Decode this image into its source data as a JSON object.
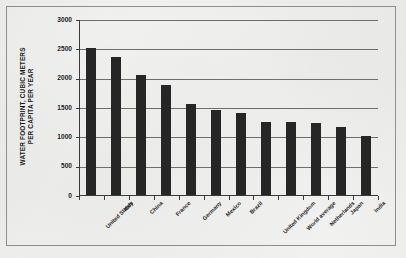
{
  "chart_data": {
    "type": "bar",
    "title": "",
    "subtitle": "",
    "xlabel": "",
    "ylabel": "WATER FOOTPRINT, CUBIC METERS\nPER CAPITA PER YEAR",
    "categories": [
      "United States",
      "Italy",
      "China",
      "France",
      "Germany",
      "Mexico",
      "Brazil",
      "United Kingdom",
      "World average",
      "Netherlands",
      "Japan",
      "India"
    ],
    "values": [
      2500,
      2350,
      2050,
      1875,
      1550,
      1450,
      1400,
      1250,
      1250,
      1230,
      1160,
      1000
    ],
    "ylim": [
      0,
      3000
    ],
    "ytick_values": [
      0,
      500,
      1000,
      1500,
      2000,
      2500,
      3000
    ],
    "ytick_labels": [
      "0",
      "500",
      "1000",
      "1500",
      "2000",
      "2500",
      "3000"
    ],
    "grid": "horizontal",
    "legend": "none",
    "bar_color": "#262626",
    "gridline_color": "#6e6e6b",
    "axis_color": "#3a3a38",
    "background_color": "#f1f1ef",
    "frame_color": "#8f8f8c"
  }
}
